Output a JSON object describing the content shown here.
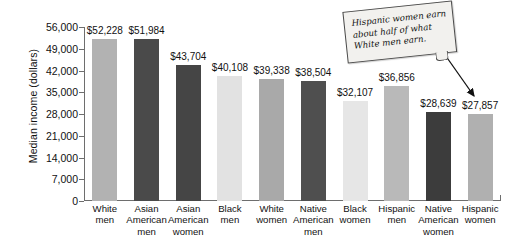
{
  "chart_data": {
    "type": "bar",
    "title": "",
    "xlabel": "",
    "ylabel": "Median income (dollars)",
    "ylim": [
      0,
      56000
    ],
    "ytick_step": 7000,
    "grid": false,
    "legend": "none",
    "categories": [
      "White men",
      "Asian American men",
      "Asian American women",
      "Black men",
      "White women",
      "Native American men",
      "Black women",
      "Hispanic men",
      "Native American women",
      "Hispanic women"
    ],
    "category_lines": [
      [
        "White",
        "men"
      ],
      [
        "Asian",
        "American",
        "men"
      ],
      [
        "Asian",
        "American",
        "women"
      ],
      [
        "Black",
        "men"
      ],
      [
        "White",
        "women"
      ],
      [
        "Native",
        "American",
        "men"
      ],
      [
        "Black",
        "women"
      ],
      [
        "Hispanic",
        "men"
      ],
      [
        "Native",
        "American",
        "women"
      ],
      [
        "Hispanic",
        "women"
      ]
    ],
    "values": [
      52228,
      51984,
      43704,
      40108,
      39338,
      38504,
      32107,
      36856,
      28639,
      27857
    ],
    "data_labels": [
      "$52,228",
      "$51,984",
      "$43,704",
      "$40,108",
      "$39,338",
      "$38,504",
      "$32,107",
      "$36,856",
      "$28,639",
      "$27,857"
    ],
    "bar_colors": [
      "#b2b2b2",
      "#4a4a4a",
      "#454545",
      "#e2e2e2",
      "#a9a9a9",
      "#4f4f4f",
      "#e6e6e6",
      "#b9b9b9",
      "#3c3c3c",
      "#b0b0b0"
    ],
    "ytick_labels": [
      "0",
      "7,000",
      "14,000",
      "21,000",
      "28,000",
      "35,000",
      "42,000",
      "49,000",
      "56,000"
    ],
    "ytick_values": [
      0,
      7000,
      14000,
      21000,
      28000,
      35000,
      42000,
      49000,
      56000
    ],
    "annotations": [
      {
        "text": "Hispanic women earn about half of what White men earn.",
        "lines": [
          "Hispanic women earn",
          "about half of what",
          "White men earn."
        ],
        "points_to": "Hispanic women",
        "style": "callout-box-with-arrow"
      }
    ],
    "axis_color": "#6e6e6e"
  }
}
